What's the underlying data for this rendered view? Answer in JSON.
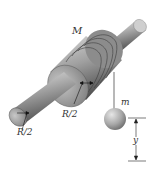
{
  "diagram": {
    "labels": {
      "spool_mass": "M",
      "hanging_mass": "m",
      "axle_radius_left": "R/2",
      "axle_radius_mid": "R/2",
      "drop_distance": "y"
    },
    "colors": {
      "metal_dark": "#5a5a5a",
      "metal_mid": "#9a9a9a",
      "metal_light": "#d8d8d8",
      "string": "#444444",
      "background": "#ffffff"
    }
  }
}
